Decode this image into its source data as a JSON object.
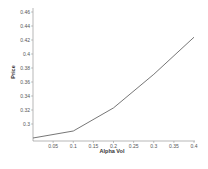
{
  "chart_data": {
    "type": "line",
    "title": "",
    "xlabel": "Alpha Vol",
    "ylabel": "Price",
    "xlim": [
      0,
      0.4
    ],
    "ylim": [
      0.2757,
      0.46
    ],
    "grid": false,
    "legend": null,
    "x_ticks": [
      0.05,
      0.1,
      0.15,
      0.2,
      0.25,
      0.3,
      0.35,
      0.4
    ],
    "x_tick_labels": [
      "0.05",
      "0.1",
      "0.15",
      "0.2",
      "0.25",
      "0.3",
      "0.35",
      "0.4"
    ],
    "y_ticks": [
      0.3,
      0.32,
      0.34,
      0.36,
      0.38,
      0.4,
      0.42,
      0.44,
      0.46
    ],
    "y_tick_labels": [
      "0.3",
      "0.32",
      "0.34",
      "0.36",
      "0.38",
      "0.4",
      "0.42",
      "0.44",
      "0.46"
    ],
    "series": [
      {
        "name": "Price",
        "color": "#666666",
        "x": [
          0.0,
          0.1,
          0.2,
          0.3,
          0.4
        ],
        "values": [
          0.28,
          0.29,
          0.323,
          0.371,
          0.424
        ]
      }
    ]
  },
  "colors": {
    "axis": "#888888",
    "line": "#666666",
    "background": "#ffffff"
  }
}
